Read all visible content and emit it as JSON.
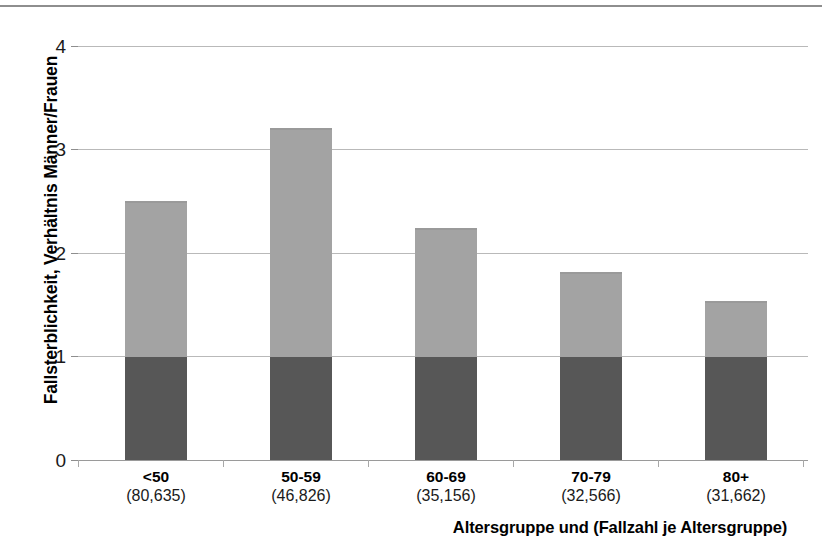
{
  "chart_data": {
    "type": "bar",
    "title": "",
    "subtitle": "",
    "xlabel": "Altersgruppe und (Fallzahl je Altersgruppe)",
    "ylabel": "Fallsterblichkeit, Verhältnis Männer/Frauen",
    "categories": [
      "<50",
      "50-59",
      "60-69",
      "70-79",
      "80+"
    ],
    "category_counts": [
      "(80,635)",
      "(46,826)",
      "(35,156)",
      "(32,566)",
      "(31,662)"
    ],
    "values": [
      2.5,
      3.21,
      2.24,
      1.82,
      1.54
    ],
    "series": [
      {
        "name": "Referenz (Frauen)",
        "values": [
          1,
          1,
          1,
          1,
          1
        ],
        "color": "#575757"
      },
      {
        "name": "Überschuss Männer",
        "values": [
          1.5,
          2.21,
          1.24,
          0.82,
          0.54
        ],
        "color": "#a3a3a3"
      }
    ],
    "stacked": true,
    "ylim": [
      0,
      4
    ],
    "yticks": [
      0,
      1,
      2,
      3,
      4
    ],
    "ytick_labels": [
      "0",
      "1",
      "2",
      "3",
      "4"
    ],
    "grid": true,
    "legend": false,
    "legend_position": "none"
  },
  "axes": {
    "y": {
      "label": "Fallsterblichkeit, Verhältnis Männer/Frauen",
      "ticks": [
        "4",
        "3",
        "2",
        "1",
        "0"
      ]
    },
    "x": {
      "label": "Altersgruppe und (Fallzahl je Altersgruppe)",
      "categories": [
        {
          "name": "<50",
          "count": "(80,635)"
        },
        {
          "name": "50-59",
          "count": "(46,826)"
        },
        {
          "name": "60-69",
          "count": "(35,156)"
        },
        {
          "name": "70-79",
          "count": "(32,566)"
        },
        {
          "name": "80+",
          "count": "(31,662)"
        }
      ]
    }
  },
  "colors": {
    "bar_lower": "#575757",
    "bar_upper": "#a3a3a3",
    "gridline": "#b9b9b9",
    "axis": "#9a9a9a",
    "rule": "#8e8e8e",
    "text": "#000000"
  }
}
